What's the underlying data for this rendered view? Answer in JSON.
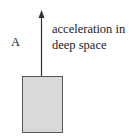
{
  "diagram": {
    "label_a": "A",
    "caption_line1": "acceleration in",
    "caption_line2": "deep space",
    "box_fill": "#d9d9d9",
    "box_stroke": "#555555",
    "arrow_color": "#333333"
  }
}
